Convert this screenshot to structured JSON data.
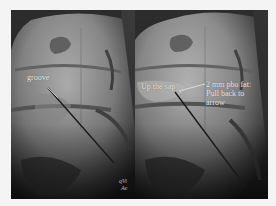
{
  "figure": {
    "left_panel": {
      "label": "groove",
      "watermark_line1": "qVi",
      "watermark_line2": "Ae"
    },
    "right_panel": {
      "label_left": "Up the sap",
      "label_right_line1": "2 mm pbo fat:",
      "label_right_line2": "Pull back to",
      "label_right_line3": "arrow"
    },
    "colors": {
      "background": "#f4f4f4",
      "xray_dark": "#222222",
      "xray_light": "#c8c8c8",
      "needle": "#1a1a1a",
      "text": "#eaeaea"
    }
  }
}
